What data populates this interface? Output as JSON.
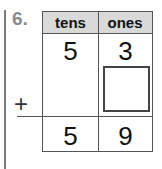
{
  "problem": {
    "number": "6.",
    "headers": {
      "tens": "tens",
      "ones": "ones"
    },
    "addend1": {
      "tens": "5",
      "ones": "3"
    },
    "addend2": {
      "tens": "",
      "ones": ""
    },
    "operator": "+",
    "sum": {
      "tens": "5",
      "ones": "9"
    }
  }
}
